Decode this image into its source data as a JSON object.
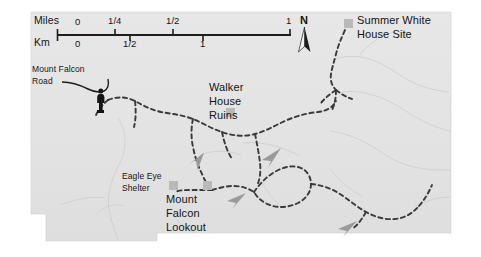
{
  "map": {
    "title": "Mount Falcon Park trail map",
    "background_color": "#ffffff",
    "panel_color": "#e4e4e4",
    "trail_color": "#3a3a3a",
    "contour_color": "#cfcfcf",
    "marker_color": "#b9b9b9",
    "text_color": "#141414",
    "scale": {
      "miles_label": "Miles",
      "km_label": "Km",
      "miles_ticks": [
        "0",
        "1/4",
        "1/2",
        "1"
      ],
      "km_ticks": [
        "0",
        "1/2",
        "1"
      ]
    },
    "compass": {
      "north_label": "N",
      "icon": "north-arrow-icon"
    },
    "labels": [
      {
        "name": "summer-white-house-site",
        "lines": [
          "Summer White",
          "House Site"
        ],
        "has_marker": true
      },
      {
        "name": "mount-falcon-road",
        "lines": [
          "Mount Falcon",
          "Road"
        ],
        "has_marker": false
      },
      {
        "name": "walker-house-ruins",
        "lines": [
          "Walker",
          "House",
          "Ruins"
        ],
        "has_marker": true
      },
      {
        "name": "eagle-eye-shelter",
        "lines": [
          "Eagle Eye",
          "Shelter"
        ],
        "has_marker": true
      },
      {
        "name": "mount-falcon-lookout",
        "lines": [
          "Mount",
          "Falcon",
          "Lookout"
        ],
        "has_marker": true
      }
    ],
    "icons": {
      "trailhead": "trailhead-figure-icon",
      "direction_arrow": "trail-direction-arrow-icon"
    }
  }
}
